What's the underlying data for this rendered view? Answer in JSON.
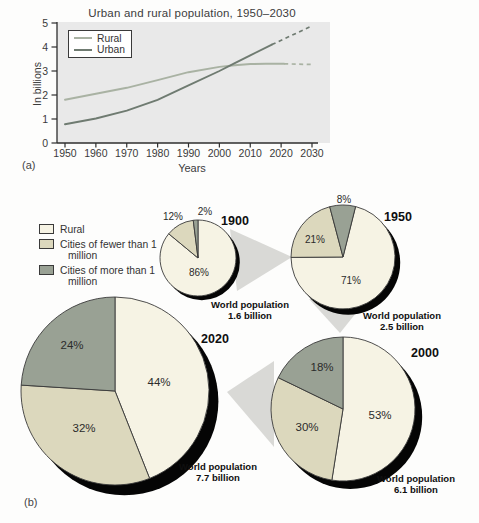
{
  "figure": {
    "panel_a_label": "(a)",
    "panel_b_label": "(b)"
  },
  "chart_data": [
    {
      "type": "line",
      "title": "Urban and rural population, 1950–2030",
      "xlabel": "Years",
      "ylabel": "In billions",
      "xlim": [
        1950,
        2030
      ],
      "ylim": [
        0,
        5
      ],
      "xticks": [
        "1950",
        "1960",
        "1970",
        "1980",
        "1990",
        "2000",
        "2010",
        "2020",
        "2030"
      ],
      "yticks": [
        "0",
        "1",
        "2",
        "3",
        "4",
        "5"
      ],
      "grid": false,
      "legend_position": "top-left",
      "plot_bg": "#e9e9e9",
      "note": "dashed segments are projections",
      "series": [
        {
          "name": "Rural",
          "color": "#a9b2a3",
          "solid": [
            [
              1950,
              1.8
            ],
            [
              1960,
              2.05
            ],
            [
              1970,
              2.3
            ],
            [
              1980,
              2.62
            ],
            [
              1990,
              2.95
            ],
            [
              2000,
              3.17
            ],
            [
              2005,
              3.24
            ],
            [
              2010,
              3.29
            ],
            [
              2015,
              3.3
            ],
            [
              2021,
              3.3
            ]
          ],
          "dashed": [
            [
              2021,
              3.3
            ],
            [
              2030,
              3.27
            ]
          ]
        },
        {
          "name": "Urban",
          "color": "#6f7b71",
          "solid": [
            [
              1950,
              0.78
            ],
            [
              1960,
              1.02
            ],
            [
              1970,
              1.35
            ],
            [
              1980,
              1.8
            ],
            [
              1990,
              2.4
            ],
            [
              2000,
              3.0
            ],
            [
              2005,
              3.33
            ],
            [
              2010,
              3.65
            ],
            [
              2017,
              4.1
            ]
          ],
          "dashed": [
            [
              2017,
              4.1
            ],
            [
              2030,
              4.88
            ]
          ]
        }
      ]
    },
    {
      "type": "pie",
      "legend": [
        "Rural",
        "Cities of fewer than 1 million",
        "Cities of more than 1 million"
      ],
      "colors": [
        "#f6f3e4",
        "#dcd8bd",
        "#99a194"
      ],
      "shadow_color": "#050505",
      "pies": [
        {
          "year": "1900",
          "values": [
            86,
            12,
            2
          ],
          "value_labels": [
            "86%",
            "12%",
            "2%"
          ],
          "caption": "World population",
          "population": "1.6 billion"
        },
        {
          "year": "1950",
          "values": [
            71,
            21,
            8
          ],
          "value_labels": [
            "71%",
            "21%",
            "8%"
          ],
          "caption": "World population",
          "population": "2.5 billion"
        },
        {
          "year": "2000",
          "values": [
            53,
            30,
            18
          ],
          "value_labels": [
            "53%",
            "30%",
            "18%"
          ],
          "caption": "World population",
          "population": "6.1 billion"
        },
        {
          "year": "2020",
          "values": [
            44,
            32,
            24
          ],
          "value_labels": [
            "44%",
            "32%",
            "24%"
          ],
          "caption": "World population",
          "population": "7.7 billion"
        }
      ]
    }
  ]
}
